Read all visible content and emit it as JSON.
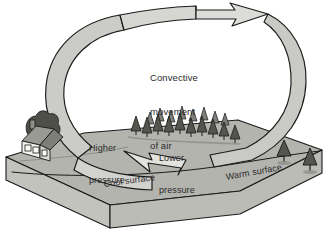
{
  "diagram": {
    "type": "convection-cell-cross-section",
    "background_color": "#ffffff"
  },
  "labels": {
    "convective": {
      "line1": "Convective",
      "line2": "movement",
      "line3": "of air"
    },
    "higher_pressure": {
      "line1": "Higher",
      "line2": "pressure"
    },
    "lower_pressure": {
      "line1": "Lower",
      "line2": "pressure"
    },
    "cool_surface": "Cool surface",
    "warm_surface": "Warm surface"
  },
  "elements": {
    "house": "house-icon",
    "forest": "conifer-forest-icon",
    "warm_trees": "isolated-tree-icon",
    "ground_slab": "ground-slab-shape",
    "loop_arrow": "convection-loop-arrow",
    "top_arrowhead": "arrowhead-left-icon",
    "bottom_arrowhead": "arrowhead-right-icon"
  },
  "colors": {
    "outline": "#1a1a1a",
    "arrow_band": "#c9c9c6",
    "arrow_band_light": "#e2e2df",
    "ground_top": "#b3b3ae",
    "ground_side": "#bdbdb8",
    "ground_front": "#c6c6c1",
    "tree_dark": "#4a4a48",
    "tree_mid": "#8f8f8b",
    "house_roof": "#8c8c88",
    "house_wall": "#efefec",
    "text": "#2b2b2b"
  }
}
